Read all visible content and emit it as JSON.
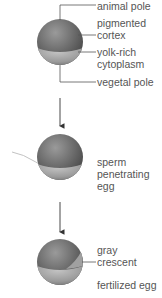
{
  "diagram": {
    "stages": [
      {
        "name": "unfertilized-egg",
        "labels": {
          "animal_pole": "animal pole",
          "pigmented_cortex_1": "pigmented",
          "pigmented_cortex_2": "cortex",
          "yolk_1": "yolk-rich",
          "yolk_2": "cytoplasm",
          "vegetal_pole": "vegetal pole"
        }
      },
      {
        "name": "sperm-penetration",
        "labels": {
          "line1": "sperm",
          "line2": "penetrating",
          "line3": "egg"
        }
      },
      {
        "name": "fertilized-egg",
        "labels": {
          "gray_1": "gray",
          "gray_2": "crescent",
          "caption": "fertilized egg"
        }
      }
    ],
    "colors": {
      "animal_hemisphere": "#6e6e6e",
      "vegetal_hemisphere": "#a8a8a8",
      "line": "#555555",
      "text": "#555555"
    }
  }
}
